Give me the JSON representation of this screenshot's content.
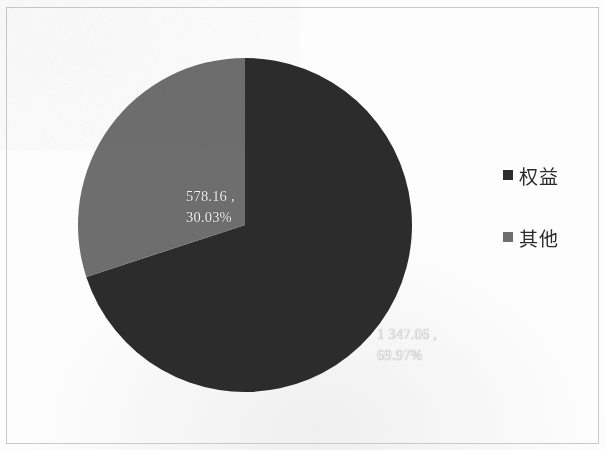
{
  "figure": {
    "background_color": "#fdfdfd",
    "frame_color": "#c9c9cc"
  },
  "chart_data": {
    "type": "pie",
    "title": "",
    "subtitle": "",
    "xlabel": "",
    "ylabel": "",
    "grid": false,
    "legend_position": "right",
    "start_angle_deg": 0,
    "direction": "clockwise",
    "categories": [
      "权益",
      "其他"
    ],
    "values": [
      1347.06,
      578.16
    ],
    "percentages": [
      69.97,
      30.03
    ],
    "colors": [
      "#2e2b2b",
      "#6e6e6e"
    ],
    "slices": [
      {
        "name": "权益",
        "value": 1347.06,
        "value_text": "1 347.06",
        "percent": 69.97,
        "percent_text": "69.97%",
        "color": "#2e2b2b",
        "label_text": "1 347.06 ,\n69.97%"
      },
      {
        "name": "其他",
        "value": 578.16,
        "value_text": "578.16",
        "percent": 30.03,
        "percent_text": "30.03%",
        "color": "#6e6e6e",
        "label_text": "578.16 ,\n30.03%"
      }
    ],
    "data_label_color": "#f2f2f2"
  },
  "labels": {
    "other": "578.16 ,\n30.03%",
    "equity": "1 347.06 ,\n69.97%"
  },
  "legend": {
    "items": [
      {
        "label": "权益",
        "color": "#2e2b2b",
        "marker": "square-marker"
      },
      {
        "label": "其他",
        "color": "#6e6e6e",
        "marker": "square-marker"
      }
    ]
  }
}
